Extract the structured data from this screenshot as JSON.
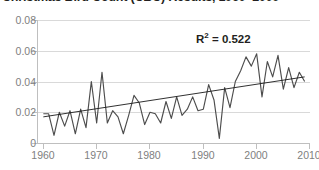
{
  "title": "Christmas Bird Count (CBC) Results, 1960–2009",
  "annotation": {
    "r2_prefix": "R",
    "r2_exponent": "2",
    "r2_value": "= 0.522",
    "r2_full": "R2 = 0.522"
  },
  "colors": {
    "data_line": "#4d4d4d",
    "trend_line": "#1a1a1a",
    "gridline": "#d9d9d9",
    "axis": "#bfbfbf",
    "tick_text": "#808080",
    "title_text": "#231f20",
    "background": "#ffffff"
  },
  "chart_data": {
    "type": "line",
    "title": "Christmas Bird Count (CBC) Results, 1960–2009",
    "xlabel": "",
    "ylabel": "",
    "xlim": [
      1959,
      2010
    ],
    "ylim": [
      0,
      0.08
    ],
    "grid": true,
    "legend": null,
    "ytick_labels": [
      "0",
      "0.02",
      "0.04",
      "0.06",
      "0.08"
    ],
    "ytick_values": [
      0,
      0.02,
      0.04,
      0.06,
      0.08
    ],
    "xtick_labels": [
      "1960",
      "1970",
      "1980",
      "1990",
      "2000",
      "2010"
    ],
    "xtick_values": [
      1960,
      1970,
      1980,
      1990,
      2000,
      2010
    ],
    "annotations": [
      {
        "text": "R2 = 0.522",
        "x": 1996,
        "y": 0.072
      }
    ],
    "series": [
      {
        "name": "CBC Results",
        "type": "line",
        "x": [
          1960,
          1961,
          1962,
          1963,
          1964,
          1965,
          1966,
          1967,
          1968,
          1969,
          1970,
          1971,
          1972,
          1973,
          1974,
          1975,
          1976,
          1977,
          1978,
          1979,
          1980,
          1981,
          1982,
          1983,
          1984,
          1985,
          1986,
          1987,
          1988,
          1989,
          1990,
          1991,
          1992,
          1993,
          1994,
          1995,
          1996,
          1997,
          1998,
          1999,
          2000,
          2001,
          2002,
          2003,
          2004,
          2005,
          2006,
          2007,
          2008,
          2009
        ],
        "values": [
          0.019,
          0.019,
          0.005,
          0.02,
          0.011,
          0.021,
          0.006,
          0.022,
          0.01,
          0.04,
          0.013,
          0.046,
          0.013,
          0.021,
          0.017,
          0.006,
          0.018,
          0.031,
          0.026,
          0.012,
          0.02,
          0.019,
          0.013,
          0.027,
          0.016,
          0.03,
          0.018,
          0.022,
          0.03,
          0.021,
          0.022,
          0.038,
          0.028,
          0.003,
          0.036,
          0.023,
          0.04,
          0.047,
          0.056,
          0.05,
          0.058,
          0.03,
          0.053,
          0.043,
          0.057,
          0.035,
          0.049,
          0.036,
          0.046,
          0.04
        ]
      },
      {
        "name": "Linear trend",
        "type": "trend",
        "x": [
          1960,
          2009
        ],
        "values": [
          0.017,
          0.043
        ],
        "r_squared": 0.522
      }
    ]
  }
}
